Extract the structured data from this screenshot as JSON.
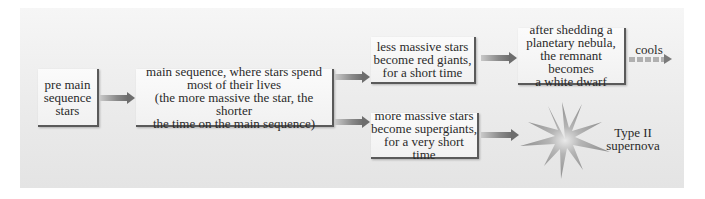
{
  "diagram": {
    "nodes": {
      "pre_main_sequence": "pre main\nsequence\nstars",
      "main_sequence": "main sequence, where stars spend\nmost of their lives\n(the more massive the star, the shorter\nthe time on the main sequence)",
      "less_massive": "less massive stars\nbecome red giants,\nfor a short time",
      "more_massive": "more massive stars\nbecome supergiants,\nfor a very short time",
      "white_dwarf": "after shedding a\nplanetary nebula,\nthe remnant becomes\na white dwarf",
      "supernova_label": "Type II\nsupernova"
    },
    "edge_labels": {
      "cools": "cools"
    },
    "icons": {
      "supernova": "starburst-icon"
    },
    "colors": {
      "panel_bg": "#ececec",
      "box_bg": "#f6f6f6",
      "box_shadow": "#5a5a5a",
      "arrow": "#7a7a7a"
    }
  }
}
